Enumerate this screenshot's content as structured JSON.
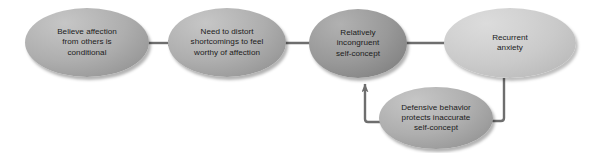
{
  "diagram": {
    "canvas": {
      "width": 593,
      "height": 153,
      "background": "#ffffff"
    },
    "palette": {
      "node_mid": "#aeaeae",
      "node_dark": "#999999",
      "node_light": "#cacaca",
      "connector": "#6e6e6e",
      "text": "#1b1b1b"
    },
    "nodes": [
      {
        "id": "believe-affection",
        "label": "Believe affection\nfrom others is\nconditional",
        "tone": "mid",
        "x": 25,
        "y": 8,
        "w": 124,
        "h": 69
      },
      {
        "id": "need-to-distort",
        "label": "Need to distort\nshortcomings to feel\nworthy of affection",
        "tone": "mid",
        "x": 168,
        "y": 8,
        "w": 118,
        "h": 69
      },
      {
        "id": "incongruent-self-concept",
        "label": "Relatively\nincongruent\nself-concept",
        "tone": "dark",
        "x": 309,
        "y": 9,
        "w": 98,
        "h": 69
      },
      {
        "id": "recurrent-anxiety",
        "label": "Recurrent\nanxiety",
        "tone": "light",
        "x": 444,
        "y": 8,
        "w": 132,
        "h": 70
      },
      {
        "id": "defensive-behavior",
        "label": "Defensive behavior\nprotects inaccurate\nself-concept",
        "tone": "mid",
        "x": 379,
        "y": 87,
        "w": 114,
        "h": 62
      }
    ],
    "connectors": [
      {
        "id": "c1",
        "from": "believe-affection",
        "to": "need-to-distort",
        "kind": "straight-right"
      },
      {
        "id": "c2",
        "from": "need-to-distort",
        "to": "incongruent-self-concept",
        "kind": "straight-right"
      },
      {
        "id": "c3",
        "from": "incongruent-self-concept",
        "to": "recurrent-anxiety",
        "kind": "straight-right"
      },
      {
        "id": "c4",
        "from": "recurrent-anxiety",
        "to": "defensive-behavior",
        "kind": "elbow-down-left"
      },
      {
        "id": "c5",
        "from": "defensive-behavior",
        "to": "incongruent-self-concept",
        "kind": "elbow-left-up"
      }
    ]
  }
}
